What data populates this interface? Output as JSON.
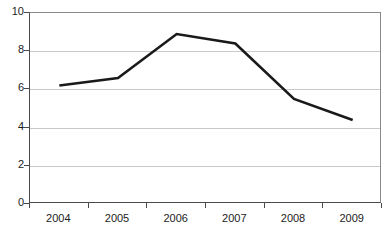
{
  "chart_data": {
    "type": "line",
    "title": "",
    "subtitle": "",
    "xlabel": "",
    "ylabel": "",
    "categories": [
      "2004",
      "2005",
      "2006",
      "2007",
      "2008",
      "2009"
    ],
    "values": [
      6.2,
      6.6,
      8.9,
      8.4,
      5.5,
      4.4
    ],
    "series": [
      {
        "name": "",
        "values": [
          6.2,
          6.6,
          8.9,
          8.4,
          5.5,
          4.4
        ],
        "color": "#1a1a1a",
        "line_width": 2.6,
        "markers": false
      }
    ],
    "ylim": [
      0,
      10
    ],
    "y_ticks": [
      0,
      2,
      4,
      6,
      8,
      10
    ],
    "y_tick_labels": [
      "0",
      "2",
      "4",
      "6",
      "8",
      "10"
    ],
    "x_tick_labels": [
      "2004",
      "2005",
      "2006",
      "2007",
      "2008",
      "2009"
    ],
    "grid": {
      "horizontal": true,
      "vertical": false,
      "color": "#c9c9c9"
    },
    "legend": {
      "visible": false,
      "position": "none",
      "entries": []
    },
    "annotations": [],
    "plot_border": {
      "visible": true,
      "color": "#8a8a8a"
    },
    "axis_color": "#4a4a4a",
    "background_color": "#ffffff"
  }
}
